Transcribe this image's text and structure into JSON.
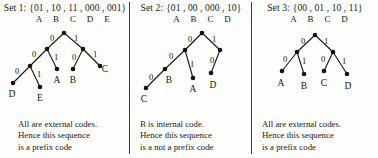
{
  "figure": {
    "panel_count": 3,
    "ink_color": "#141414",
    "background_color": "#fdfdfb"
  },
  "panels": [
    {
      "set_label": "Set 1:",
      "set_codes": "{01 , 10 , 11 , 000 , 001}",
      "letters": [
        "A",
        "B",
        "C",
        "D",
        "E"
      ],
      "caption_lines": [
        "All are external codes.",
        "Hence this sequence",
        "is a prefix code"
      ],
      "codewords": [
        {
          "letter": "A",
          "code": "01"
        },
        {
          "letter": "B",
          "code": "10"
        },
        {
          "letter": "C",
          "code": "11"
        },
        {
          "letter": "D",
          "code": "000"
        },
        {
          "letter": "E",
          "code": "001"
        }
      ],
      "tree": {
        "nodes": [
          {
            "id": "root",
            "x": 64,
            "y": 8,
            "label": ""
          },
          {
            "id": "n0",
            "x": 47,
            "y": 24,
            "label": ""
          },
          {
            "id": "n1",
            "x": 83,
            "y": 24,
            "label": ""
          },
          {
            "id": "n00",
            "x": 30,
            "y": 41,
            "label": ""
          },
          {
            "id": "n01",
            "x": 57,
            "y": 44,
            "label": "A"
          },
          {
            "id": "n10",
            "x": 73,
            "y": 44,
            "label": "B"
          },
          {
            "id": "n11",
            "x": 100,
            "y": 41,
            "label": "C"
          },
          {
            "id": "n000",
            "x": 13,
            "y": 58,
            "label": "D"
          },
          {
            "id": "n001",
            "x": 40,
            "y": 62,
            "label": "E"
          }
        ],
        "edges": [
          {
            "from": "root",
            "to": "n0",
            "bit": "0",
            "bx": 52,
            "by": 16
          },
          {
            "from": "root",
            "to": "n1",
            "bit": "1",
            "bx": 76,
            "by": 16
          },
          {
            "from": "n0",
            "to": "n00",
            "bit": "0",
            "bx": 34,
            "by": 32
          },
          {
            "from": "n0",
            "to": "n01",
            "bit": "1",
            "bx": 56,
            "by": 35
          },
          {
            "from": "n1",
            "to": "n10",
            "bit": "0",
            "bx": 74,
            "by": 35
          },
          {
            "from": "n1",
            "to": "n11",
            "bit": "1",
            "bx": 95,
            "by": 32
          },
          {
            "from": "n00",
            "to": "n000",
            "bit": "0",
            "bx": 17,
            "by": 49
          },
          {
            "from": "n00",
            "to": "n001",
            "bit": "1",
            "bx": 39,
            "by": 52
          }
        ],
        "leaf_labels": [
          {
            "for": "n01",
            "text": "A",
            "lx": 57,
            "ly": 58
          },
          {
            "for": "n10",
            "text": "B",
            "lx": 73,
            "ly": 58
          },
          {
            "for": "n11",
            "text": "C",
            "lx": 105,
            "ly": 47
          },
          {
            "for": "n000",
            "text": "D",
            "lx": 12,
            "ly": 72
          },
          {
            "for": "n001",
            "text": "E",
            "lx": 40,
            "ly": 76
          }
        ]
      }
    },
    {
      "set_label": "Set 2:",
      "set_codes": "{01 , 00 , 000 , 10}",
      "letters": [
        "A",
        "B",
        "C",
        "D"
      ],
      "caption_lines": [
        "B is internal code.",
        "Hence this sequence",
        "is a not a prefix code"
      ],
      "codewords": [
        {
          "letter": "A",
          "code": "01"
        },
        {
          "letter": "B",
          "code": "00"
        },
        {
          "letter": "C",
          "code": "000"
        },
        {
          "letter": "D",
          "code": "10"
        }
      ],
      "tree": {
        "nodes": [
          {
            "id": "root",
            "x": 72,
            "y": 8,
            "label": ""
          },
          {
            "id": "n0",
            "x": 55,
            "y": 25,
            "label": ""
          },
          {
            "id": "n1",
            "x": 90,
            "y": 25,
            "label": ""
          },
          {
            "id": "n00",
            "x": 35,
            "y": 44,
            "label": "B"
          },
          {
            "id": "n01",
            "x": 63,
            "y": 53,
            "label": "A"
          },
          {
            "id": "n10",
            "x": 81,
            "y": 48,
            "label": "D"
          },
          {
            "id": "n000",
            "x": 16,
            "y": 63,
            "label": "C"
          }
        ],
        "edges": [
          {
            "from": "root",
            "to": "n0",
            "bit": "0",
            "bx": 60,
            "by": 17
          },
          {
            "from": "root",
            "to": "n1",
            "bit": "1",
            "bx": 84,
            "by": 17
          },
          {
            "from": "n0",
            "to": "n00",
            "bit": "0",
            "bx": 41,
            "by": 34
          },
          {
            "from": "n0",
            "to": "n01",
            "bit": "1",
            "bx": 62,
            "by": 42
          },
          {
            "from": "n1",
            "to": "n10",
            "bit": "0",
            "bx": 82,
            "by": 38
          },
          {
            "from": "n00",
            "to": "n000",
            "bit": "0",
            "bx": 21,
            "by": 55
          }
        ],
        "leaf_labels": [
          {
            "for": "n00",
            "text": "B",
            "lx": 39,
            "ly": 58
          },
          {
            "for": "n01",
            "text": "A",
            "lx": 63,
            "ly": 67
          },
          {
            "for": "n10",
            "text": "D",
            "lx": 83,
            "ly": 63
          },
          {
            "for": "n000",
            "text": "C",
            "lx": 14,
            "ly": 77
          }
        ]
      }
    },
    {
      "set_label": "Set 3:",
      "set_codes": "{00 , 01 , 10 , 11}",
      "letters": [
        "A",
        "B",
        "C",
        "D"
      ],
      "caption_lines": [
        "All are external codes.",
        "Hence this sequence",
        "is a prefix code"
      ],
      "codewords": [
        {
          "letter": "A",
          "code": "00"
        },
        {
          "letter": "B",
          "code": "01"
        },
        {
          "letter": "C",
          "code": "10"
        },
        {
          "letter": "D",
          "code": "11"
        }
      ],
      "tree": {
        "nodes": [
          {
            "id": "root",
            "x": 63,
            "y": 10,
            "label": ""
          },
          {
            "id": "n0",
            "x": 45,
            "y": 27,
            "label": ""
          },
          {
            "id": "n1",
            "x": 81,
            "y": 27,
            "label": ""
          },
          {
            "id": "n00",
            "x": 30,
            "y": 46,
            "label": "A"
          },
          {
            "id": "n01",
            "x": 52,
            "y": 49,
            "label": "B"
          },
          {
            "id": "n10",
            "x": 72,
            "y": 46,
            "label": "C"
          },
          {
            "id": "n11",
            "x": 95,
            "y": 49,
            "label": "D"
          }
        ],
        "edges": [
          {
            "from": "root",
            "to": "n0",
            "bit": "0",
            "bx": 51,
            "by": 19
          },
          {
            "from": "root",
            "to": "n1",
            "bit": "1",
            "bx": 74,
            "by": 19
          },
          {
            "from": "n0",
            "to": "n00",
            "bit": "0",
            "bx": 33,
            "by": 37
          },
          {
            "from": "n0",
            "to": "n01",
            "bit": "1",
            "bx": 52,
            "by": 39
          },
          {
            "from": "n1",
            "to": "n10",
            "bit": "0",
            "bx": 71,
            "by": 37
          },
          {
            "from": "n1",
            "to": "n11",
            "bit": "1",
            "bx": 92,
            "by": 39
          }
        ],
        "leaf_labels": [
          {
            "for": "n00",
            "text": "A",
            "lx": 29,
            "ly": 61
          },
          {
            "for": "n01",
            "text": "B",
            "lx": 52,
            "ly": 64
          },
          {
            "for": "n10",
            "text": "C",
            "lx": 72,
            "ly": 61
          },
          {
            "for": "n11",
            "text": "D",
            "lx": 96,
            "ly": 64
          }
        ]
      }
    }
  ]
}
